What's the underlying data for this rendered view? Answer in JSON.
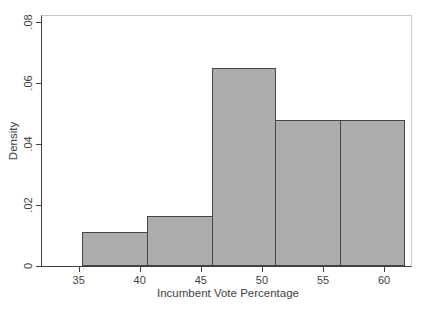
{
  "chart_data": {
    "type": "bar",
    "subtype": "histogram",
    "title": "",
    "xlabel": "Incumbent Vote Percentage",
    "ylabel": "Density",
    "bin_edges": [
      35.3,
      40.6,
      45.9,
      51.1,
      56.4,
      61.6
    ],
    "densities": [
      0.011,
      0.0165,
      0.065,
      0.048,
      0.048
    ],
    "x_ticks": [
      {
        "value": 35,
        "label": "35"
      },
      {
        "value": 40,
        "label": "40"
      },
      {
        "value": 45,
        "label": "45"
      },
      {
        "value": 50,
        "label": "50"
      },
      {
        "value": 55,
        "label": "55"
      },
      {
        "value": 60,
        "label": "60"
      }
    ],
    "y_ticks": [
      {
        "value": 0,
        "label": "0"
      },
      {
        "value": 0.02,
        "label": ".02"
      },
      {
        "value": 0.04,
        "label": ".04"
      },
      {
        "value": 0.06,
        "label": ".06"
      },
      {
        "value": 0.08,
        "label": ".08"
      }
    ],
    "xlim": [
      32.0,
      62.2
    ],
    "ylim": [
      0,
      0.082
    ],
    "grid": false,
    "legend": "none",
    "colors": {
      "bar_fill": "#acacac",
      "bar_outline": "#454545",
      "axis_line": "#3f3f3f",
      "frame_line": "#c9c9c9",
      "text": "#3f3f3f"
    }
  }
}
